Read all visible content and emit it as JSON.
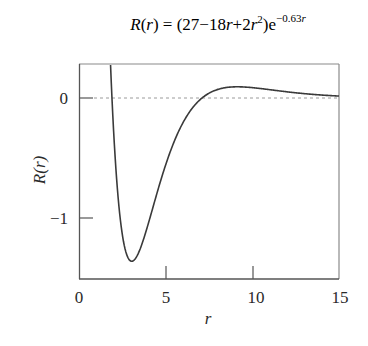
{
  "chart_data": {
    "type": "line",
    "title_parts": {
      "lhs": "R",
      "lhs_arg": "r",
      "equals": "=",
      "poly": "(27−18",
      "r1": "r",
      "plus": "+2",
      "r2": "r",
      "sq": "2",
      "close": ")e",
      "exp": "−0.63",
      "exp_r": "r"
    },
    "xlabel": "r",
    "ylabel": "R(r)",
    "xlim": [
      0,
      15
    ],
    "ylim": [
      -1.51,
      0.29
    ],
    "xticks": [
      0,
      5,
      10,
      15
    ],
    "xtick_labels": [
      "0",
      "5",
      "10",
      "15"
    ],
    "yticks": [
      0,
      -1
    ],
    "ytick_labels": [
      "0",
      "−1"
    ],
    "grid": false,
    "reference_line": {
      "y": 0,
      "style": "dashed",
      "color": "#9a9a9a"
    },
    "series": [
      {
        "name": "R(r)",
        "color": "#3a3a3a",
        "x": [
          1.82,
          1.9,
          2.0,
          2.25,
          2.5,
          2.75,
          3.0,
          3.25,
          3.5,
          4.0,
          4.5,
          5.0,
          5.5,
          6.0,
          6.5,
          7.0,
          7.5,
          8.0,
          8.5,
          9.0,
          9.5,
          10.0,
          11.0,
          12.0,
          13.0,
          14.0,
          15.0
        ],
        "values": [
          0.275,
          0.006,
          -0.284,
          -0.78,
          -1.139,
          -1.31,
          -1.36,
          -1.33,
          -1.267,
          -1.046,
          -0.8,
          -0.557,
          -0.36,
          -0.205,
          -0.09,
          -0.012,
          0.036,
          0.071,
          0.087,
          0.093,
          0.091,
          0.086,
          0.069,
          0.052,
          0.037,
          0.025,
          0.016
        ]
      }
    ],
    "minimum": {
      "r": 3.0,
      "R": -1.36
    }
  }
}
